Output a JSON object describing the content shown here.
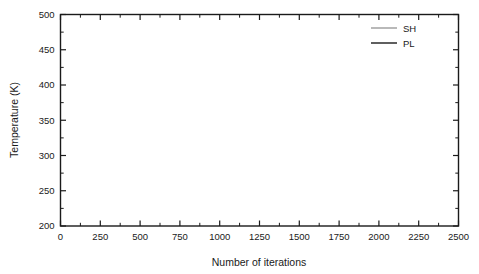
{
  "chart_data": {
    "type": "line",
    "title": "",
    "xlabel": "Number of iterations",
    "ylabel": "Temperature (K)",
    "xlim": [
      0,
      2500
    ],
    "ylim": [
      200,
      500
    ],
    "xticks": [
      0,
      250,
      500,
      750,
      1000,
      1250,
      1500,
      1750,
      2000,
      2250,
      2500
    ],
    "yticks": [
      200,
      250,
      300,
      350,
      400,
      450,
      500
    ],
    "xtick_labels": [
      "0",
      "250",
      "500",
      "750",
      "1000",
      "1250",
      "1500",
      "1750",
      "2000",
      "2250",
      "2500"
    ],
    "ytick_labels": [
      "200",
      "250",
      "300",
      "350",
      "400",
      "450",
      "500"
    ],
    "x_minor_step": 125,
    "y_minor_step": 25,
    "grid": false,
    "legend_position": "top-right",
    "legend": [
      "SH",
      "PL"
    ],
    "series": [
      {
        "name": "SH",
        "color": "#a8a8a8",
        "width": 0.9,
        "x_start": 0,
        "x_step": 12.5,
        "values": [
          386,
          383,
          380,
          378,
          381,
          377,
          374,
          378,
          382,
          379,
          375,
          378,
          384,
          388,
          384,
          379,
          376,
          380,
          385,
          381,
          377,
          374,
          378,
          383,
          387,
          383,
          378,
          375,
          379,
          384,
          380,
          376,
          373,
          377,
          382,
          386,
          390,
          385,
          380,
          377,
          381,
          385,
          381,
          377,
          374,
          378,
          383,
          379,
          375,
          372,
          376,
          381,
          385,
          381,
          377,
          374,
          370,
          374,
          378,
          374,
          371,
          368,
          372,
          376,
          380,
          376,
          372,
          369,
          373,
          377,
          381,
          385,
          389,
          392,
          388,
          384,
          380,
          377,
          381,
          385,
          382,
          378,
          375,
          379,
          383,
          387,
          383,
          379,
          376,
          380,
          384,
          388,
          384,
          380,
          376,
          373,
          377,
          381,
          385,
          389,
          393,
          389,
          385,
          381,
          378,
          382,
          386,
          390,
          386,
          382,
          379,
          383,
          387,
          391,
          387,
          383,
          380,
          384,
          388,
          392,
          388,
          384,
          381,
          385,
          389,
          386,
          382,
          379,
          383,
          387,
          391,
          387,
          384,
          380,
          377,
          381,
          385,
          389,
          393,
          389,
          385,
          382,
          386,
          390,
          387,
          383,
          380,
          384,
          388,
          392,
          396,
          392,
          388,
          384,
          381,
          385,
          389,
          386,
          382,
          379,
          383,
          387,
          391,
          388,
          384,
          381,
          385,
          389,
          385,
          382,
          386,
          390,
          394,
          390,
          386,
          383,
          387,
          391,
          388,
          384,
          381,
          385,
          389,
          393,
          389,
          385,
          382,
          378,
          374,
          378,
          382,
          386,
          382,
          379,
          383,
          387,
          391,
          387,
          383,
          380
        ]
      },
      {
        "name": "PL",
        "color": "#1a1a1a",
        "width": 1.1,
        "x_start": 0,
        "x_step": 12.5,
        "values": [
          322,
          318,
          314,
          318,
          323,
          319,
          316,
          320,
          325,
          321,
          317,
          321,
          326,
          322,
          318,
          322,
          327,
          323,
          319,
          323,
          328,
          324,
          320,
          324,
          328,
          324,
          321,
          325,
          329,
          325,
          322,
          326,
          330,
          326,
          323,
          327,
          331,
          327,
          324,
          328,
          332,
          328,
          325,
          321,
          325,
          329,
          326,
          322,
          326,
          330,
          327,
          323,
          327,
          331,
          328,
          324,
          328,
          332,
          329,
          325,
          329,
          333,
          330,
          326,
          322,
          326,
          330,
          334,
          331,
          327,
          331,
          335,
          332,
          328,
          324,
          328,
          332,
          329,
          325,
          329,
          333,
          330,
          326,
          330,
          334,
          331,
          327,
          323,
          327,
          331,
          335,
          332,
          328,
          332,
          336,
          333,
          329,
          325,
          329,
          333,
          337,
          334,
          330,
          334,
          338,
          335,
          331,
          327,
          331,
          335,
          339,
          336,
          332,
          336,
          340,
          337,
          333,
          337,
          341,
          338,
          334,
          330,
          334,
          338,
          342,
          339,
          335,
          339,
          343,
          340,
          336,
          332,
          336,
          340,
          344,
          341,
          337,
          341,
          345,
          342,
          338,
          334,
          338,
          342,
          346,
          343,
          339,
          343,
          347,
          344,
          340,
          336,
          332,
          336,
          340,
          344,
          348,
          345,
          341,
          345,
          349,
          346,
          342,
          346,
          350,
          347,
          343,
          347,
          351,
          348,
          344,
          348,
          352,
          349,
          353,
          357,
          354,
          350,
          354,
          358,
          355,
          351,
          355,
          359,
          356,
          352,
          356,
          360,
          357,
          353,
          357,
          361,
          358,
          362,
          365,
          362,
          358,
          362,
          365,
          362
        ]
      }
    ]
  },
  "axes": {
    "x_title": "Number of iterations",
    "y_title": "Temperature (K)"
  },
  "legend": {
    "items": [
      {
        "label": "SH",
        "color": "#a8a8a8"
      },
      {
        "label": "PL",
        "color": "#1a1a1a"
      }
    ]
  }
}
